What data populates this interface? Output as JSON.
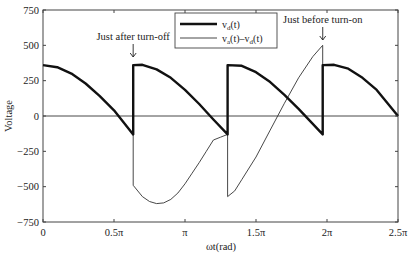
{
  "chart_data": {
    "type": "line",
    "title": "",
    "xlabel": "ωt(rad)",
    "ylabel": "Voltage",
    "xlim_pi": [
      0,
      2.5
    ],
    "ylim": [
      -750,
      750
    ],
    "grid": false,
    "x_ticks": [
      {
        "value_pi": 0,
        "label": "0"
      },
      {
        "value_pi": 0.5,
        "label": "0.5π"
      },
      {
        "value_pi": 1.0,
        "label": "π"
      },
      {
        "value_pi": 1.5,
        "label": "1.5π"
      },
      {
        "value_pi": 2.0,
        "label": "2π"
      },
      {
        "value_pi": 2.5,
        "label": "2.5π"
      }
    ],
    "y_ticks": [
      {
        "value": 750,
        "label": "750"
      },
      {
        "value": 500,
        "label": "500"
      },
      {
        "value": 250,
        "label": "250"
      },
      {
        "value": 0,
        "label": "0"
      },
      {
        "value": -250,
        "label": "−250"
      },
      {
        "value": -500,
        "label": "−500"
      },
      {
        "value": -750,
        "label": "−750"
      }
    ],
    "legend": {
      "placement": "top-center",
      "entries": [
        {
          "name": "v_d(t)",
          "main": "v",
          "sub": "d",
          "suffix": "(t)",
          "style": "thick"
        },
        {
          "name": "v_a(t)-v_d(t)",
          "main": "v",
          "sub": "a",
          "mid": "(t)–v",
          "sub2": "d",
          "suffix": "(t)",
          "style": "thin"
        }
      ]
    },
    "annotations": [
      {
        "text": "Just after turn-off",
        "x_pi": 0.635,
        "arrow": "down"
      },
      {
        "text": "Just before turn-on",
        "x_pi": 1.97,
        "arrow": "down"
      }
    ],
    "series": [
      {
        "name": "v_d(t)",
        "style": "thick",
        "x_pi": [
          0,
          0.1,
          0.2,
          0.3,
          0.4,
          0.5,
          0.635,
          0.635,
          0.7,
          0.8,
          0.9,
          1.0,
          1.1,
          1.2,
          1.3,
          1.3,
          1.4,
          1.5,
          1.6,
          1.7,
          1.8,
          1.97,
          1.97,
          2.05,
          2.15,
          2.25,
          2.35,
          2.5
        ],
        "values": [
          360,
          345,
          300,
          230,
          140,
          40,
          -130,
          360,
          362,
          330,
          270,
          185,
          85,
          -25,
          -130,
          360,
          355,
          310,
          240,
          150,
          50,
          -130,
          360,
          362,
          335,
          270,
          185,
          0
        ]
      },
      {
        "name": "v_a(t)-v_d(t)",
        "style": "thin",
        "x_pi": [
          0.635,
          0.635,
          0.7,
          0.75,
          0.8,
          0.85,
          0.9,
          0.95,
          1.0,
          1.05,
          1.1,
          1.15,
          1.2,
          1.25,
          1.3,
          1.3,
          1.35,
          1.4,
          1.5,
          1.6,
          1.7,
          1.8,
          1.9,
          1.97,
          1.97
        ],
        "values": [
          -130,
          -490,
          -570,
          -605,
          -620,
          -615,
          -590,
          -545,
          -480,
          -405,
          -330,
          -250,
          -170,
          -150,
          -130,
          -570,
          -530,
          -450,
          -290,
          -100,
          90,
          270,
          420,
          500,
          -130
        ]
      },
      {
        "name": "zero-line",
        "style": "axis",
        "x_pi": [
          0,
          2.5
        ],
        "values": [
          0,
          0
        ]
      }
    ]
  }
}
